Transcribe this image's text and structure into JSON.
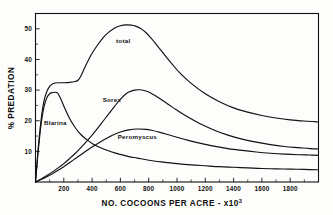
{
  "chart_data": {
    "type": "line",
    "title": "",
    "xlabel": "NO. COCOONS PER ACRE - x10",
    "xlabel_exponent": "3",
    "ylabel": "% PREDATION",
    "xlim": [
      0,
      2000
    ],
    "ylim": [
      0,
      55
    ],
    "grid": false,
    "legend_position": "inline-curve-labels",
    "xticks": [
      200,
      400,
      600,
      800,
      1000,
      1200,
      1400,
      1600,
      1800
    ],
    "xtick_labels": [
      "200",
      "400",
      "600",
      "800",
      "1000",
      "1200",
      "1400",
      "1600",
      "1800"
    ],
    "xminor_ticks": [
      100,
      300,
      500,
      700,
      900,
      1100,
      1300,
      1500,
      1700,
      1900
    ],
    "yticks": [
      10,
      20,
      30,
      40,
      50
    ],
    "ytick_labels": [
      "10",
      "20",
      "30",
      "40",
      "50"
    ],
    "yminor_ticks": [
      5,
      15,
      25,
      35,
      45
    ],
    "series": [
      {
        "name": "total",
        "label": "total",
        "label_x": 620,
        "label_y": 45.5,
        "x": [
          0,
          20,
          40,
          60,
          80,
          100,
          120,
          140,
          160,
          180,
          200,
          240,
          280,
          300,
          320,
          360,
          400,
          440,
          480,
          520,
          560,
          600,
          640,
          680,
          700,
          740,
          780,
          820,
          860,
          900,
          960,
          1020,
          1100,
          1200,
          1300,
          1400,
          1500,
          1600,
          1700,
          1800,
          1900,
          2000
        ],
        "y": [
          0,
          11.5,
          20.5,
          26.5,
          29.5,
          31.2,
          32.0,
          32.3,
          32.4,
          32.4,
          32.4,
          32.5,
          32.8,
          33.2,
          34.5,
          38.5,
          42.0,
          44.8,
          47.2,
          49.0,
          50.3,
          51.0,
          51.3,
          51.2,
          51.0,
          50.2,
          48.8,
          46.8,
          44.5,
          42.2,
          38.8,
          35.6,
          32.2,
          28.8,
          26.2,
          24.2,
          22.8,
          21.7,
          20.9,
          20.3,
          19.9,
          19.6
        ]
      },
      {
        "name": "Blarina",
        "label": "Blarina",
        "label_x": 140,
        "label_y": 18.5,
        "x": [
          0,
          20,
          40,
          60,
          80,
          100,
          120,
          140,
          150,
          160,
          180,
          200,
          240,
          280,
          320,
          360,
          400,
          440,
          480,
          520,
          560,
          600,
          660,
          720,
          800,
          900,
          1000,
          1100,
          1200,
          1300,
          1400,
          1500,
          1600,
          1700,
          1800,
          1900,
          2000
        ],
        "y": [
          0,
          10.5,
          19.0,
          24.5,
          27.5,
          28.8,
          29.2,
          29.3,
          29.2,
          28.8,
          27.0,
          24.8,
          20.8,
          17.8,
          15.5,
          13.9,
          12.6,
          11.6,
          10.8,
          10.1,
          9.5,
          9.0,
          8.3,
          7.8,
          7.1,
          6.5,
          6.0,
          5.6,
          5.3,
          5.0,
          4.8,
          4.6,
          4.4,
          4.3,
          4.2,
          4.1,
          4.0
        ]
      },
      {
        "name": "Sorex",
        "label": "Sorex",
        "label_x": 540,
        "label_y": 26.0,
        "x": [
          0,
          40,
          80,
          120,
          160,
          200,
          240,
          280,
          320,
          360,
          400,
          440,
          480,
          520,
          560,
          600,
          640,
          660,
          700,
          740,
          780,
          820,
          880,
          940,
          1000,
          1080,
          1160,
          1260,
          1360,
          1460,
          1560,
          1660,
          1760,
          1860,
          1940,
          2000
        ],
        "y": [
          0,
          1.0,
          2.1,
          3.3,
          4.6,
          6.0,
          7.6,
          9.3,
          11.2,
          13.2,
          15.3,
          17.6,
          20.0,
          22.4,
          24.8,
          27.0,
          28.8,
          29.4,
          30.0,
          30.1,
          29.7,
          28.9,
          27.2,
          25.3,
          23.4,
          21.1,
          19.1,
          17.0,
          15.3,
          14.0,
          13.0,
          12.2,
          11.6,
          11.2,
          10.9,
          10.8
        ]
      },
      {
        "name": "Peromyscus",
        "label": "Peromyscus",
        "label_x": 720,
        "label_y": 14.0,
        "x": [
          0,
          40,
          80,
          120,
          160,
          200,
          240,
          280,
          320,
          360,
          400,
          440,
          480,
          520,
          560,
          600,
          660,
          720,
          780,
          820,
          880,
          940,
          1000,
          1080,
          1160,
          1260,
          1360,
          1460,
          1560,
          1660,
          1760,
          1860,
          1940,
          2000
        ],
        "y": [
          0,
          0.8,
          1.7,
          2.7,
          3.8,
          5.0,
          6.3,
          7.6,
          8.9,
          10.2,
          11.4,
          12.6,
          13.7,
          14.7,
          15.6,
          16.3,
          17.0,
          17.3,
          17.2,
          16.9,
          16.2,
          15.4,
          14.6,
          13.6,
          12.7,
          11.7,
          10.9,
          10.3,
          9.8,
          9.4,
          9.1,
          8.9,
          8.8,
          8.7
        ]
      }
    ]
  },
  "figure": {
    "caption": ""
  }
}
